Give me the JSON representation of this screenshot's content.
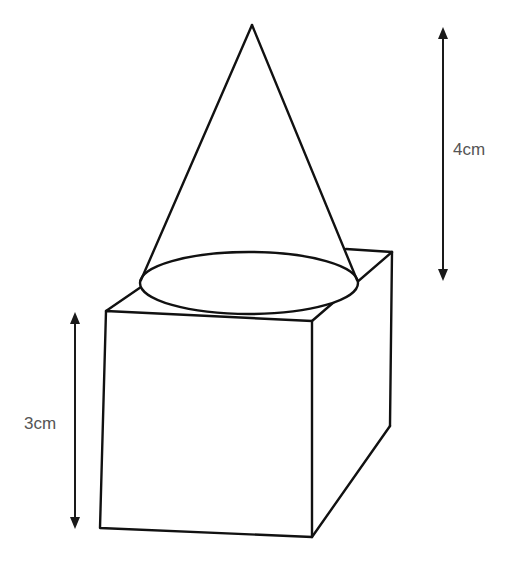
{
  "diagram": {
    "shapes": {
      "cone": {
        "apex": [
          252,
          25
        ],
        "base_ellipse": {
          "cx": 249,
          "cy": 283,
          "rx": 109,
          "ry": 31
        },
        "left_tangent": [
          141,
          280
        ],
        "right_tangent": [
          357,
          280
        ]
      },
      "cuboid": {
        "front_face": [
          [
            106,
            311
          ],
          [
            312,
            321
          ],
          [
            312,
            537
          ],
          [
            100,
            528
          ]
        ],
        "top_back_left_visible": [
          [
            106,
            311
          ],
          [
            141,
            287
          ]
        ],
        "top_back_visible": [
          [
            346,
            249
          ],
          [
            392,
            252
          ]
        ],
        "top_right_edge": [
          [
            312,
            321
          ],
          [
            392,
            252
          ]
        ],
        "back_right_edge": [
          [
            392,
            252
          ],
          [
            390,
            426
          ]
        ],
        "bottom_right_edge": [
          [
            312,
            537
          ],
          [
            390,
            426
          ]
        ]
      }
    },
    "dimensions": [
      {
        "name": "cone-height",
        "label": "4cm",
        "x": 443,
        "y1": 28,
        "y2": 280,
        "label_x": 453,
        "label_y": 155
      },
      {
        "name": "cuboid-height",
        "label": "3cm",
        "x": 75,
        "y1": 313,
        "y2": 528,
        "label_x": 24,
        "label_y": 429
      }
    ],
    "colors": {
      "line": "#111111",
      "label": "#555555",
      "background": "#ffffff"
    }
  }
}
